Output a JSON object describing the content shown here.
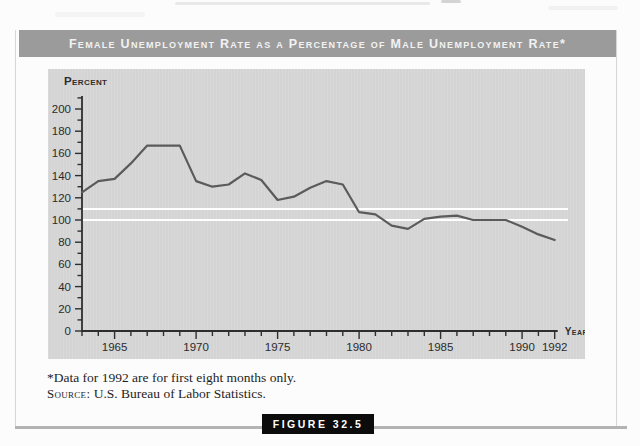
{
  "figure": {
    "title": "Female Unemployment Rate as a Percentage of Male Unemployment Rate*",
    "tag": "Figure 32.5"
  },
  "footnotes": {
    "asterisk": "*Data for 1992 are for first eight months only.",
    "source_label": "Source:",
    "source_text": "U.S. Bureau of Labor Statistics."
  },
  "colors": {
    "title_bar_bg": "#9b9b9b",
    "title_text": "#f2f2f2",
    "panel_bg": "#d7d7d7",
    "axis": "#2e2e2e",
    "axis_text": "#2b2b2b",
    "data_line": "#5b5b5b",
    "reference_line": "#ffffff",
    "figure_tag_bg": "#0c0c0c",
    "figure_tag_text": "#ffffff",
    "bottom_rule": "#b3b3b3"
  },
  "chart_data": {
    "type": "line",
    "title": "Female Unemployment Rate as a Percentage of Male Unemployment Rate",
    "xlabel": "Year",
    "ylabel": "Percent",
    "x": [
      1963,
      1964,
      1965,
      1966,
      1967,
      1968,
      1969,
      1970,
      1971,
      1972,
      1973,
      1974,
      1975,
      1976,
      1977,
      1978,
      1979,
      1980,
      1981,
      1982,
      1983,
      1984,
      1985,
      1986,
      1987,
      1988,
      1989,
      1990,
      1991,
      1992
    ],
    "values": [
      125,
      135,
      137,
      151,
      167,
      167,
      167,
      135,
      130,
      132,
      142,
      136,
      118,
      121,
      129,
      135,
      132,
      107,
      105,
      95,
      92,
      101,
      103,
      104,
      100,
      100,
      100,
      94,
      87,
      82
    ],
    "ylim": [
      0,
      210
    ],
    "xticks_labeled": [
      1965,
      1970,
      1975,
      1980,
      1985,
      1990,
      1992
    ],
    "ytick_label_step": 20,
    "ytick_minor_step": 10,
    "xtick_minor_step": 1,
    "reference_lines": [
      110,
      100
    ],
    "grid": "off",
    "legend": "none"
  }
}
